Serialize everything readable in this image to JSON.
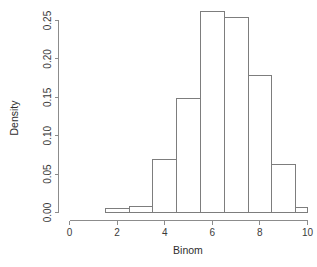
{
  "chart_data": {
    "type": "bar",
    "title": "",
    "subtitle": "",
    "xlabel": "Binom",
    "ylabel": "Density",
    "grid": false,
    "legend": null,
    "legend_position": "none",
    "xlim": [
      0,
      10
    ],
    "ylim": [
      0.0,
      0.26
    ],
    "xticks": [
      0,
      2,
      4,
      6,
      8,
      10
    ],
    "xtick_labels": [
      "0",
      "2",
      "4",
      "6",
      "8",
      "10"
    ],
    "yticks": [
      0.0,
      0.05,
      0.1,
      0.15,
      0.2,
      0.25
    ],
    "ytick_labels": [
      "0.00",
      "0.05",
      "0.10",
      "0.15",
      "0.20",
      "0.25"
    ],
    "bin_edges": [
      1.5,
      2.5,
      3.5,
      4.5,
      5.5,
      6.5,
      7.5,
      8.5,
      9.5,
      10.0
    ],
    "categories": [
      "1.5-2.5",
      "2.5-3.5",
      "3.5-4.5",
      "4.5-5.5",
      "5.5-6.5",
      "6.5-7.5",
      "7.5-8.5",
      "8.5-9.5",
      "9.5-10.0"
    ],
    "values": [
      0.005,
      0.008,
      0.069,
      0.148,
      0.262,
      0.254,
      0.178,
      0.062,
      0.007
    ]
  },
  "axes": {
    "x_title": "Binom",
    "y_title": "Density"
  }
}
